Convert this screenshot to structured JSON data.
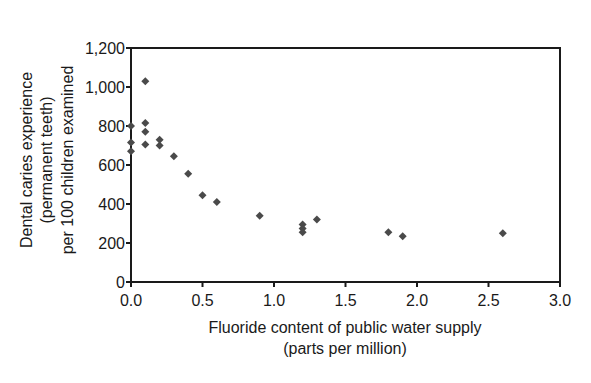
{
  "chart_data": {
    "type": "scatter",
    "title": "",
    "xlabel": [
      "Fluoride content of public water supply",
      "(parts per million)"
    ],
    "ylabel": [
      "Dental caries experience",
      "(permanent teeth)",
      "per 100 children examined"
    ],
    "xlim": [
      0,
      3.0
    ],
    "ylim": [
      0,
      1200
    ],
    "x_ticks": [
      "0.0",
      "0.5",
      "1.0",
      "1.5",
      "2.0",
      "2.5",
      "3.0"
    ],
    "y_ticks": [
      "0",
      "200",
      "400",
      "600",
      "800",
      "1,000",
      "1,200"
    ],
    "grid": false,
    "legend": null,
    "marker": "diamond",
    "marker_color": "#4a4a4a",
    "series": [
      {
        "name": "Cities",
        "points": [
          {
            "x": 0.0,
            "y": 800
          },
          {
            "x": 0.0,
            "y": 715
          },
          {
            "x": 0.0,
            "y": 670
          },
          {
            "x": 0.1,
            "y": 1030
          },
          {
            "x": 0.1,
            "y": 815
          },
          {
            "x": 0.1,
            "y": 770
          },
          {
            "x": 0.1,
            "y": 705
          },
          {
            "x": 0.2,
            "y": 730
          },
          {
            "x": 0.2,
            "y": 700
          },
          {
            "x": 0.3,
            "y": 645
          },
          {
            "x": 0.4,
            "y": 555
          },
          {
            "x": 0.5,
            "y": 445
          },
          {
            "x": 0.6,
            "y": 410
          },
          {
            "x": 0.9,
            "y": 340
          },
          {
            "x": 1.2,
            "y": 295
          },
          {
            "x": 1.2,
            "y": 275
          },
          {
            "x": 1.2,
            "y": 255
          },
          {
            "x": 1.3,
            "y": 320
          },
          {
            "x": 1.8,
            "y": 255
          },
          {
            "x": 1.9,
            "y": 235
          },
          {
            "x": 2.6,
            "y": 250
          }
        ]
      }
    ]
  }
}
